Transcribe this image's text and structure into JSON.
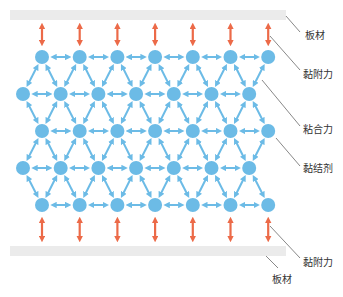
{
  "diagram": {
    "title": "",
    "colors": {
      "plate": "#ebebeb",
      "particle": "#6cbbe6",
      "cohesion_arrow": "#6cbbe6",
      "adhesion_arrow": "#ec6a48",
      "leader_line": "#555555",
      "label_text": "#333333"
    },
    "labels": {
      "top_plate": "板材",
      "top_adhesion": "黏附力",
      "cohesion": "粘合力",
      "adhesive": "黏结剂",
      "bottom_adhesion": "黏附力",
      "bottom_plate": "板材"
    },
    "structure": {
      "rows": 5,
      "particles_per_row": 7,
      "adhesion_arrows_top": 7,
      "adhesion_arrows_bottom": 7
    }
  }
}
